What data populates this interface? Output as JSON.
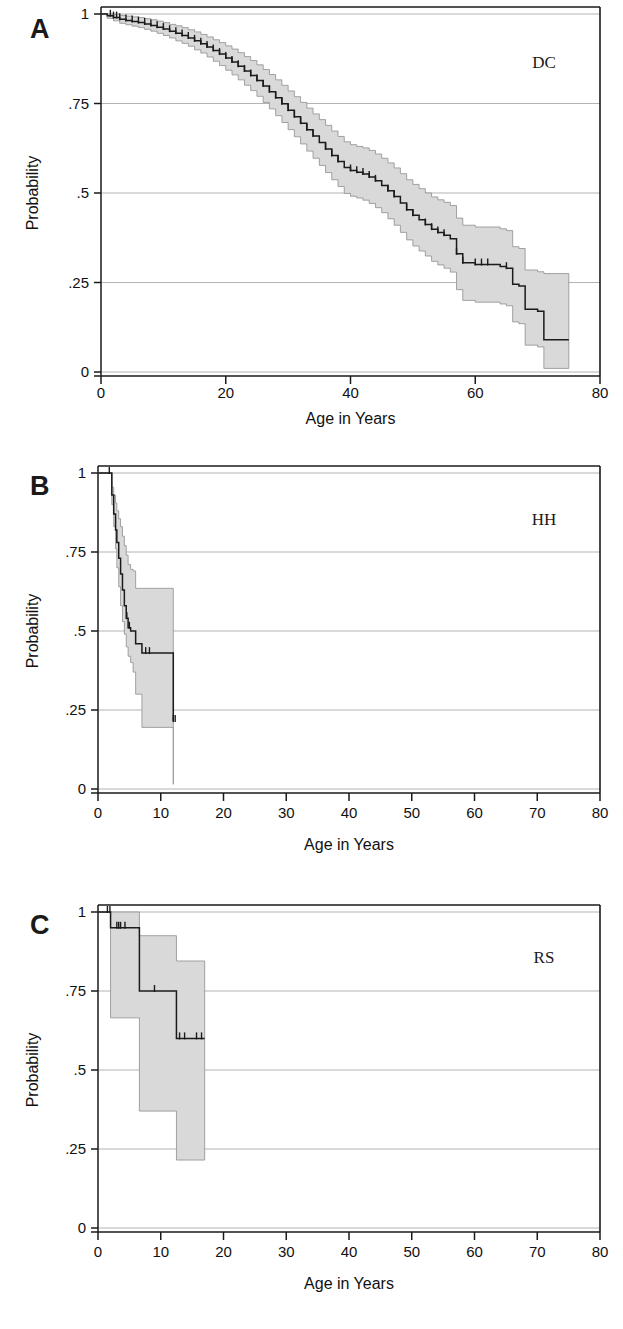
{
  "figure": {
    "panels": [
      {
        "id": "A",
        "letter": "A",
        "group_label": "DC",
        "ylabel": "Probability",
        "xlabel": "Age in Years",
        "x_ticks": [
          0,
          20,
          40,
          60,
          80
        ],
        "x_tick_labels": [
          "0",
          "20",
          "40",
          "60",
          "80"
        ],
        "y_ticks": [
          0,
          0.25,
          0.5,
          0.75,
          1
        ],
        "y_tick_labels": [
          "0",
          ".25",
          ".5",
          ".75",
          "1"
        ]
      },
      {
        "id": "B",
        "letter": "B",
        "group_label": "HH",
        "ylabel": "Probability",
        "xlabel": "Age in Years",
        "x_ticks": [
          0,
          10,
          20,
          30,
          40,
          50,
          60,
          70,
          80
        ],
        "x_tick_labels": [
          "0",
          "10",
          "20",
          "30",
          "40",
          "50",
          "60",
          "70",
          "80"
        ],
        "y_ticks": [
          0,
          0.25,
          0.5,
          0.75,
          1
        ],
        "y_tick_labels": [
          "0",
          ".25",
          ".5",
          ".75",
          "1"
        ]
      },
      {
        "id": "C",
        "letter": "C",
        "group_label": "RS",
        "ylabel": "Probability",
        "xlabel": "Age in Years",
        "x_ticks": [
          0,
          10,
          20,
          30,
          40,
          50,
          60,
          70,
          80
        ],
        "x_tick_labels": [
          "0",
          "10",
          "20",
          "30",
          "40",
          "50",
          "60",
          "70",
          "80"
        ],
        "y_ticks": [
          0,
          0.25,
          0.5,
          0.75,
          1
        ],
        "y_tick_labels": [
          "0",
          ".25",
          ".5",
          ".75",
          "1"
        ]
      }
    ]
  },
  "colors": {
    "ci_band_fill": "#d9d9d9",
    "ci_band_stroke": "#8e8e8e",
    "km_line": "#1b1b1b",
    "gridline": "#aaaaaa",
    "axis": "#1a1a1a",
    "background": "#ffffff"
  },
  "chart_data": [
    {
      "type": "line",
      "panel": "A",
      "title": "DC",
      "subtitle": "Kaplan-Meier survival estimate with 95% confidence band",
      "xlabel": "Age in Years",
      "ylabel": "Probability",
      "xlim": [
        0,
        80
      ],
      "ylim": [
        0,
        1
      ],
      "xticks": [
        0,
        20,
        40,
        60,
        80
      ],
      "yticks": [
        0,
        0.25,
        0.5,
        0.75,
        1
      ],
      "grid": true,
      "legend": "none",
      "series": [
        {
          "name": "survival",
          "step": "post",
          "x": [
            0,
            1,
            2,
            3,
            4,
            5,
            6,
            7,
            8,
            9,
            10,
            11,
            12,
            13,
            14,
            15,
            16,
            17,
            18,
            19,
            20,
            21,
            22,
            23,
            24,
            25,
            26,
            27,
            28,
            29,
            30,
            31,
            32,
            33,
            34,
            35,
            36,
            37,
            38,
            39,
            40,
            41,
            42,
            43,
            44,
            45,
            46,
            47,
            48,
            49,
            50,
            51,
            52,
            53,
            54,
            55,
            56,
            57,
            58,
            60,
            62,
            64,
            65,
            66,
            67,
            68,
            70,
            71,
            75
          ],
          "y": [
            1.0,
            0.995,
            0.99,
            0.985,
            0.982,
            0.979,
            0.976,
            0.972,
            0.968,
            0.963,
            0.958,
            0.952,
            0.946,
            0.94,
            0.933,
            0.925,
            0.917,
            0.908,
            0.898,
            0.888,
            0.877,
            0.866,
            0.854,
            0.841,
            0.828,
            0.814,
            0.799,
            0.783,
            0.766,
            0.749,
            0.731,
            0.713,
            0.695,
            0.677,
            0.659,
            0.641,
            0.623,
            0.605,
            0.588,
            0.571,
            0.563,
            0.558,
            0.553,
            0.545,
            0.534,
            0.521,
            0.506,
            0.49,
            0.472,
            0.453,
            0.438,
            0.425,
            0.412,
            0.399,
            0.39,
            0.382,
            0.372,
            0.33,
            0.305,
            0.3,
            0.3,
            0.295,
            0.29,
            0.245,
            0.24,
            0.175,
            0.17,
            0.09,
            0.09
          ]
        },
        {
          "name": "ci_upper",
          "step": "post",
          "x": [
            0,
            1,
            2,
            3,
            4,
            5,
            6,
            7,
            8,
            9,
            10,
            11,
            12,
            13,
            14,
            15,
            16,
            17,
            18,
            19,
            20,
            21,
            22,
            23,
            24,
            25,
            26,
            27,
            28,
            29,
            30,
            31,
            32,
            33,
            34,
            35,
            36,
            37,
            38,
            39,
            40,
            41,
            42,
            43,
            44,
            45,
            46,
            47,
            48,
            49,
            50,
            51,
            52,
            53,
            54,
            55,
            56,
            57,
            58,
            60,
            62,
            64,
            65,
            66,
            67,
            68,
            70,
            71,
            75
          ],
          "y": [
            1.0,
            1.0,
            0.999,
            0.996,
            0.994,
            0.992,
            0.99,
            0.987,
            0.984,
            0.98,
            0.976,
            0.971,
            0.967,
            0.962,
            0.956,
            0.95,
            0.943,
            0.936,
            0.928,
            0.92,
            0.911,
            0.902,
            0.892,
            0.881,
            0.87,
            0.858,
            0.845,
            0.831,
            0.816,
            0.801,
            0.785,
            0.769,
            0.753,
            0.737,
            0.721,
            0.705,
            0.689,
            0.673,
            0.658,
            0.643,
            0.635,
            0.63,
            0.626,
            0.619,
            0.609,
            0.597,
            0.584,
            0.57,
            0.554,
            0.537,
            0.524,
            0.512,
            0.5,
            0.489,
            0.481,
            0.474,
            0.465,
            0.43,
            0.41,
            0.405,
            0.405,
            0.4,
            0.395,
            0.35,
            0.345,
            0.285,
            0.28,
            0.275,
            0.275
          ]
        },
        {
          "name": "ci_lower",
          "step": "post",
          "x": [
            0,
            1,
            2,
            3,
            4,
            5,
            6,
            7,
            8,
            9,
            10,
            11,
            12,
            13,
            14,
            15,
            16,
            17,
            18,
            19,
            20,
            21,
            22,
            23,
            24,
            25,
            26,
            27,
            28,
            29,
            30,
            31,
            32,
            33,
            34,
            35,
            36,
            37,
            38,
            39,
            40,
            41,
            42,
            43,
            44,
            45,
            46,
            47,
            48,
            49,
            50,
            51,
            52,
            53,
            54,
            55,
            56,
            57,
            58,
            60,
            62,
            64,
            65,
            66,
            67,
            68,
            70,
            71,
            75
          ],
          "y": [
            1.0,
            0.988,
            0.981,
            0.974,
            0.97,
            0.966,
            0.962,
            0.957,
            0.952,
            0.946,
            0.94,
            0.933,
            0.925,
            0.918,
            0.91,
            0.9,
            0.891,
            0.88,
            0.868,
            0.856,
            0.843,
            0.83,
            0.816,
            0.801,
            0.786,
            0.77,
            0.753,
            0.735,
            0.716,
            0.697,
            0.677,
            0.657,
            0.637,
            0.617,
            0.597,
            0.577,
            0.557,
            0.537,
            0.518,
            0.499,
            0.491,
            0.486,
            0.48,
            0.471,
            0.459,
            0.445,
            0.428,
            0.41,
            0.39,
            0.369,
            0.352,
            0.338,
            0.324,
            0.309,
            0.299,
            0.29,
            0.279,
            0.23,
            0.2,
            0.195,
            0.195,
            0.19,
            0.185,
            0.14,
            0.135,
            0.075,
            0.07,
            0.01,
            0.01
          ]
        }
      ],
      "censor_marks_x": [
        1.5,
        2,
        2.5,
        3,
        4,
        5,
        6,
        7,
        8,
        9,
        10,
        11,
        12,
        13,
        14,
        15,
        16,
        17,
        18,
        19,
        20,
        21,
        22,
        23,
        24,
        25,
        26,
        27,
        28,
        29,
        30,
        31,
        32,
        33,
        34,
        36,
        37,
        38,
        40,
        41,
        42,
        43,
        44,
        46,
        47,
        49,
        50,
        52,
        53,
        54,
        55,
        57,
        58,
        60,
        61,
        62,
        65
      ]
    },
    {
      "type": "line",
      "panel": "B",
      "title": "HH",
      "subtitle": "Kaplan-Meier survival estimate with 95% confidence band",
      "xlabel": "Age in Years",
      "ylabel": "Probability",
      "xlim": [
        0,
        80
      ],
      "ylim": [
        0,
        1
      ],
      "xticks": [
        0,
        10,
        20,
        30,
        40,
        50,
        60,
        70,
        80
      ],
      "yticks": [
        0,
        0.25,
        0.5,
        0.75,
        1
      ],
      "grid": true,
      "legend": "none",
      "series": [
        {
          "name": "survival",
          "step": "post",
          "x": [
            0,
            1.8,
            2.2,
            2.5,
            2.8,
            3.0,
            3.3,
            3.6,
            3.9,
            4.2,
            4.5,
            4.8,
            5.2,
            5.6,
            6.0,
            7.0,
            8.0,
            11.5,
            12.0
          ],
          "y": [
            1.0,
            1.0,
            0.93,
            0.87,
            0.82,
            0.78,
            0.73,
            0.68,
            0.63,
            0.58,
            0.54,
            0.51,
            0.5,
            0.5,
            0.46,
            0.43,
            0.43,
            0.43,
            0.215
          ]
        },
        {
          "name": "ci_upper",
          "step": "post",
          "x": [
            0,
            1.8,
            2.2,
            2.5,
            2.8,
            3.0,
            3.3,
            3.6,
            3.9,
            4.2,
            4.5,
            4.8,
            5.2,
            5.6,
            6.0,
            7.0,
            8.0,
            11.5,
            12.0
          ],
          "y": [
            1.0,
            1.0,
            0.955,
            0.93,
            0.905,
            0.88,
            0.855,
            0.83,
            0.8,
            0.77,
            0.74,
            0.71,
            0.695,
            0.69,
            0.635,
            0.635,
            0.635,
            0.635,
            0.555
          ]
        },
        {
          "name": "ci_lower",
          "step": "post",
          "x": [
            0,
            1.8,
            2.2,
            2.5,
            2.8,
            3.0,
            3.3,
            3.6,
            3.9,
            4.2,
            4.5,
            4.8,
            5.2,
            5.6,
            6.0,
            7.0,
            8.0,
            11.5,
            12.0
          ],
          "y": [
            1.0,
            1.0,
            0.9,
            0.83,
            0.76,
            0.7,
            0.64,
            0.58,
            0.53,
            0.49,
            0.45,
            0.42,
            0.4,
            0.37,
            0.3,
            0.195,
            0.195,
            0.195,
            0.015
          ]
        }
      ],
      "censor_marks_x": [
        1.8,
        4.6,
        5.0,
        7.6,
        8.2,
        12.0,
        12.3
      ]
    },
    {
      "type": "line",
      "panel": "C",
      "title": "RS",
      "subtitle": "Kaplan-Meier survival estimate with 95% confidence band",
      "xlabel": "Age in Years",
      "ylabel": "Probability",
      "xlim": [
        0,
        80
      ],
      "ylim": [
        0,
        1
      ],
      "xticks": [
        0,
        10,
        20,
        30,
        40,
        50,
        60,
        70,
        80
      ],
      "yticks": [
        0,
        0.25,
        0.5,
        0.75,
        1
      ],
      "grid": true,
      "legend": "none",
      "series": [
        {
          "name": "survival",
          "step": "post",
          "x": [
            0,
            1.7,
            2.0,
            6.0,
            6.6,
            11.8,
            12.5,
            17.0
          ],
          "y": [
            1.0,
            1.0,
            0.95,
            0.95,
            0.75,
            0.75,
            0.6,
            0.6
          ]
        },
        {
          "name": "ci_upper",
          "step": "post",
          "x": [
            0,
            1.7,
            2.0,
            6.0,
            6.6,
            11.8,
            12.5,
            17.0
          ],
          "y": [
            1.0,
            1.0,
            1.0,
            1.0,
            0.925,
            0.925,
            0.845,
            0.845
          ]
        },
        {
          "name": "ci_lower",
          "step": "post",
          "x": [
            0,
            1.7,
            2.0,
            6.0,
            6.6,
            11.8,
            12.5,
            17.0
          ],
          "y": [
            1.0,
            1.0,
            0.665,
            0.665,
            0.37,
            0.37,
            0.215,
            0.215
          ]
        }
      ],
      "censor_marks_x": [
        1.5,
        1.9,
        3.0,
        3.3,
        3.6,
        4.3,
        9.0,
        13.0,
        13.8,
        15.7,
        16.5
      ]
    }
  ]
}
